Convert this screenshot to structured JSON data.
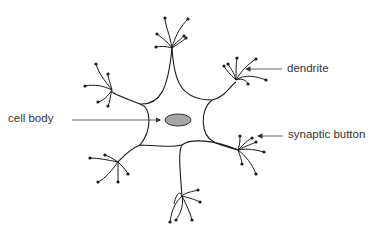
{
  "diagram": {
    "type": "neuron",
    "labels": {
      "dendrite": "dendrite",
      "cell_body": "cell body",
      "synaptic_button": "synaptic button"
    },
    "colors": {
      "stroke": "#1a1a1a",
      "nucleus_fill": "#a6a6a6",
      "label_text": "#333333",
      "arrow": "#555555"
    }
  }
}
